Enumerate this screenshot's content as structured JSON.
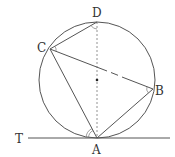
{
  "diagram": {
    "colors": {
      "stroke": "#555555",
      "text": "#333333",
      "background": "#ffffff"
    },
    "circle": {
      "cx": 97,
      "cy": 80,
      "r": 58
    },
    "points": {
      "A": {
        "label": "A",
        "x": 97,
        "y": 138
      },
      "B": {
        "label": "B",
        "x": 153,
        "y": 89
      },
      "C": {
        "label": "C",
        "x": 50,
        "y": 49
      },
      "D": {
        "label": "D",
        "x": 97,
        "y": 22
      },
      "T": {
        "label": "T"
      }
    },
    "segments": [
      "CD",
      "CB",
      "CA",
      "BA",
      "TA (tangent)"
    ],
    "dashed": [
      "DA (diameter)"
    ],
    "angle_marks": [
      "D",
      "C",
      "B",
      "A"
    ]
  }
}
